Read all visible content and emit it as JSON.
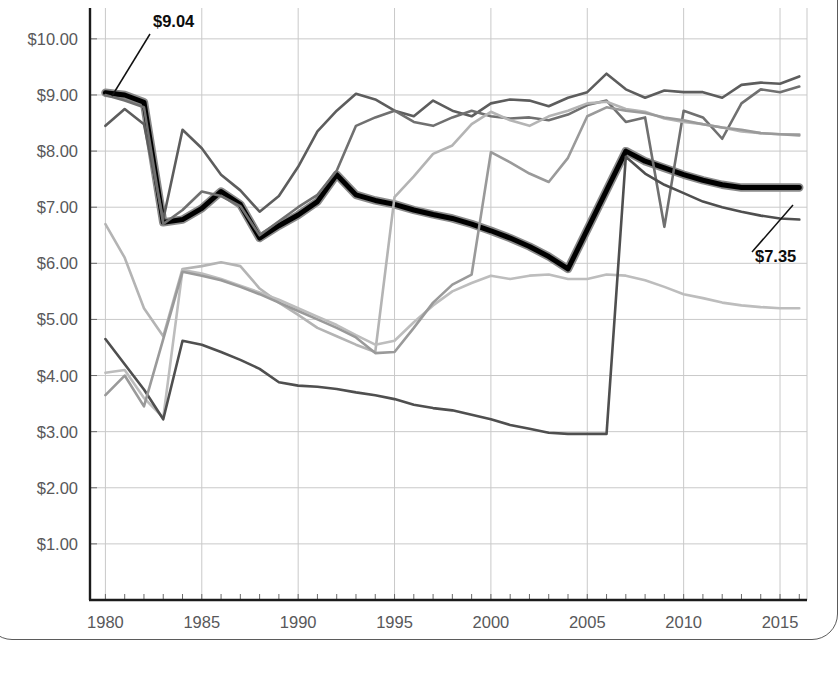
{
  "page": {
    "background": "#ffffff",
    "frame_color": "#5b5b5b"
  },
  "chart_data": {
    "type": "line",
    "title": "",
    "xlabel": "",
    "ylabel": "",
    "xlim": [
      1979.2,
      2016.4
    ],
    "ylim": [
      0.0,
      10.55
    ],
    "ylim_visible": [
      1.0,
      10.0
    ],
    "grid": true,
    "grid_color": "#c9c9c9",
    "legend": "none",
    "axis_color": "#1b1b1b",
    "y_tick_labels": [
      "$10.00",
      "$9.00",
      "$8.00",
      "$7.00",
      "$6.00",
      "$5.00",
      "$4.00",
      "$3.00",
      "$2.00",
      "$1.00"
    ],
    "y_tick_values": [
      10,
      9,
      8,
      7,
      6,
      5,
      4,
      3,
      2,
      1
    ],
    "x_tick_labels": [
      "1980",
      "1985",
      "1990",
      "1995",
      "2000",
      "2005",
      "2010",
      "2015"
    ],
    "x_tick_values": [
      1980,
      1985,
      1990,
      1995,
      2000,
      2005,
      2010,
      2015
    ],
    "x_minor_step": 1,
    "annotations": [
      {
        "text": "$9.04",
        "value": 9.04,
        "x": 1980,
        "label_x": 153,
        "label_y": 27,
        "leader_from_x": 150,
        "leader_from_y": 34,
        "leader_to_x": 112,
        "leader_to_y": 96
      },
      {
        "text": "$7.35",
        "value": 7.35,
        "x": 2016,
        "label_x": 755,
        "label_y": 262,
        "leader_from_x": 752,
        "leader_from_y": 252,
        "leader_to_x": 793,
        "leader_to_y": 205
      }
    ],
    "series": [
      {
        "name": "highlighted-series",
        "color": "#000000",
        "halo_color": "#8a8a8a",
        "width": 5.0,
        "highlight": true,
        "x": [
          1980,
          1981,
          1982,
          1983,
          1984,
          1985,
          1986,
          1987,
          1988,
          1989,
          1990,
          1991,
          1992,
          1993,
          1994,
          1995,
          1996,
          1997,
          1998,
          1999,
          2000,
          2001,
          2002,
          2003,
          2004,
          2005,
          2006,
          2007,
          2008,
          2009,
          2010,
          2011,
          2012,
          2013,
          2014,
          2015,
          2016
        ],
        "values": [
          9.04,
          9.0,
          8.87,
          6.73,
          6.78,
          6.98,
          7.28,
          7.05,
          6.45,
          6.67,
          6.86,
          7.1,
          7.58,
          7.22,
          7.12,
          7.05,
          6.95,
          6.87,
          6.8,
          6.7,
          6.58,
          6.45,
          6.3,
          6.12,
          5.9,
          6.6,
          7.3,
          8.0,
          7.82,
          7.7,
          7.58,
          7.48,
          7.4,
          7.35,
          7.35,
          7.35,
          7.35
        ]
      },
      {
        "name": "series-a-dark-gray-top",
        "color": "#5d5d5d",
        "width": 2.6,
        "highlight": false,
        "x": [
          1980,
          1981,
          1982,
          1983,
          1984,
          1985,
          1986,
          1987,
          1988,
          1989,
          1990,
          1991,
          1992,
          1993,
          1994,
          1995,
          1996,
          1997,
          1998,
          1999,
          2000,
          2001,
          2002,
          2003,
          2004,
          2005,
          2006,
          2007,
          2008,
          2009,
          2010,
          2011,
          2012,
          2013,
          2014,
          2015,
          2016
        ],
        "values": [
          8.45,
          8.75,
          8.48,
          6.78,
          8.38,
          8.05,
          7.58,
          7.3,
          6.92,
          7.2,
          7.72,
          8.35,
          8.72,
          9.02,
          8.92,
          8.72,
          8.62,
          8.9,
          8.72,
          8.62,
          8.85,
          8.92,
          8.9,
          8.8,
          8.95,
          9.05,
          9.38,
          9.1,
          8.95,
          9.08,
          9.05,
          9.05,
          8.95,
          9.18,
          9.22,
          9.2,
          9.33
        ]
      },
      {
        "name": "series-b-mid-gray",
        "color": "#707070",
        "width": 2.6,
        "highlight": false,
        "x": [
          1980,
          1981,
          1982,
          1983,
          1984,
          1985,
          1986,
          1987,
          1988,
          1989,
          1990,
          1991,
          1992,
          1993,
          1994,
          1995,
          1996,
          1997,
          1998,
          1999,
          2000,
          2001,
          2002,
          2003,
          2004,
          2005,
          2006,
          2007,
          2008,
          2009,
          2010,
          2011,
          2012,
          2013,
          2014,
          2015,
          2016
        ],
        "values": [
          9.0,
          8.9,
          8.78,
          6.7,
          6.95,
          7.28,
          7.2,
          7.02,
          6.5,
          6.75,
          7.0,
          7.22,
          7.65,
          8.45,
          8.6,
          8.72,
          8.52,
          8.45,
          8.6,
          8.72,
          8.62,
          8.58,
          8.6,
          8.55,
          8.65,
          8.82,
          8.9,
          8.52,
          8.6,
          6.65,
          8.72,
          8.6,
          8.22,
          8.85,
          9.1,
          9.05,
          9.15
        ]
      },
      {
        "name": "series-c-light-gray-rising",
        "color": "#b4b4b4",
        "width": 2.6,
        "highlight": false,
        "x": [
          1980,
          1981,
          1982,
          1983,
          1984,
          1985,
          1986,
          1987,
          1988,
          1989,
          1990,
          1991,
          1992,
          1993,
          1994,
          1995,
          1996,
          1997,
          1998,
          1999,
          2000,
          2001,
          2002,
          2003,
          2004,
          2005,
          2006,
          2007,
          2008,
          2009,
          2010,
          2011,
          2012,
          2013,
          2014,
          2015,
          2016
        ],
        "values": [
          6.7,
          6.1,
          5.2,
          4.7,
          5.9,
          5.95,
          6.02,
          5.95,
          5.55,
          5.3,
          5.08,
          4.85,
          4.7,
          4.55,
          4.42,
          7.18,
          7.55,
          7.95,
          8.1,
          8.48,
          8.7,
          8.55,
          8.45,
          8.62,
          8.72,
          8.85,
          8.88,
          8.75,
          8.7,
          8.58,
          8.52,
          8.48,
          8.42,
          8.35,
          8.32,
          8.3,
          8.3
        ]
      },
      {
        "name": "series-d-light-gray-falling",
        "color": "#bdbdbd",
        "width": 2.6,
        "highlight": false,
        "x": [
          1980,
          1981,
          1982,
          1983,
          1984,
          1985,
          1986,
          1987,
          1988,
          1989,
          1990,
          1991,
          1992,
          1993,
          1994,
          1995,
          1996,
          1997,
          1998,
          1999,
          2000,
          2001,
          2002,
          2003,
          2004,
          2005,
          2006,
          2007,
          2008,
          2009,
          2010,
          2011,
          2012,
          2013,
          2014,
          2015,
          2016
        ],
        "values": [
          4.05,
          4.1,
          3.6,
          3.25,
          5.88,
          5.82,
          5.72,
          5.6,
          5.48,
          5.35,
          5.2,
          5.05,
          4.9,
          4.72,
          4.55,
          4.62,
          4.95,
          5.25,
          5.5,
          5.65,
          5.78,
          5.72,
          5.78,
          5.8,
          5.72,
          5.72,
          5.8,
          5.78,
          5.7,
          5.58,
          5.45,
          5.38,
          5.3,
          5.25,
          5.22,
          5.2,
          5.2
        ]
      },
      {
        "name": "series-e-dark-gray-bottom",
        "color": "#4f4f4f",
        "width": 2.6,
        "highlight": false,
        "x": [
          1980,
          1981,
          1982,
          1983,
          1984,
          1985,
          1986,
          1987,
          1988,
          1989,
          1990,
          1991,
          1992,
          1993,
          1994,
          1995,
          1996,
          1997,
          1998,
          1999,
          2000,
          2001,
          2002,
          2003,
          2004,
          2005,
          2006,
          2007,
          2008,
          2009,
          2010,
          2011,
          2012,
          2013,
          2014,
          2015,
          2016
        ],
        "values": [
          4.65,
          4.2,
          3.75,
          3.22,
          4.62,
          4.55,
          4.42,
          4.28,
          4.12,
          3.88,
          3.82,
          3.8,
          3.76,
          3.7,
          3.65,
          3.58,
          3.48,
          3.42,
          3.38,
          3.3,
          3.22,
          3.12,
          3.05,
          2.98,
          2.96,
          2.96,
          2.96,
          7.9,
          7.6,
          7.4,
          7.25,
          7.1,
          7.0,
          6.92,
          6.85,
          6.8,
          6.78
        ]
      },
      {
        "name": "series-f-gray-faint",
        "color": "#9a9a9a",
        "width": 2.6,
        "highlight": false,
        "x": [
          1980,
          1981,
          1982,
          1983,
          1984,
          1985,
          1986,
          1987,
          1988,
          1989,
          1990,
          1991,
          1992,
          1993,
          1994,
          1995,
          1996,
          1997,
          1998,
          1999,
          2000,
          2001,
          2002,
          2003,
          2004,
          2005,
          2006,
          2007,
          2008,
          2009,
          2010,
          2011,
          2012,
          2013,
          2014,
          2015,
          2016
        ],
        "values": [
          3.65,
          4.0,
          3.45,
          4.65,
          5.85,
          5.78,
          5.7,
          5.58,
          5.45,
          5.3,
          5.15,
          5.0,
          4.85,
          4.68,
          4.4,
          4.42,
          4.85,
          5.3,
          5.62,
          5.8,
          7.98,
          7.8,
          7.6,
          7.45,
          7.88,
          8.62,
          8.78,
          8.72,
          8.68,
          8.6,
          8.55,
          8.48,
          8.42,
          8.38,
          8.32,
          8.3,
          8.28
        ]
      }
    ]
  }
}
